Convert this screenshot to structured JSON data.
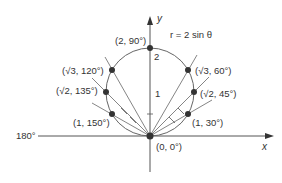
{
  "diagram": {
    "title": "r = 2 sin θ",
    "axes": {
      "x_label": "x",
      "y_label": "y",
      "left_label": "180°",
      "y_ticks": [
        "1",
        "2"
      ]
    },
    "points": [
      {
        "label": "(2, 90°)"
      },
      {
        "label": "(√3, 120°)"
      },
      {
        "label": "(√3, 60°)"
      },
      {
        "label": "(√2, 135°)"
      },
      {
        "label": "(√2, 45°)"
      },
      {
        "label": "(1, 150°)"
      },
      {
        "label": "(1, 30°)"
      },
      {
        "label": "(0, 0°)"
      }
    ],
    "colors": {
      "line": "#555555",
      "point": "#333333",
      "background": "#ffffff"
    }
  }
}
